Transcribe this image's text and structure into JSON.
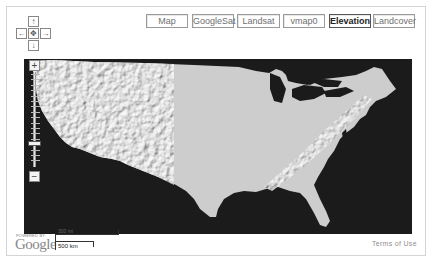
{
  "map_types": [
    {
      "label": "Map",
      "left": 0,
      "width": 42,
      "active": false
    },
    {
      "label": "GoogleSat",
      "left": 46,
      "width": 42,
      "active": false
    },
    {
      "label": "Landsat",
      "left": 91,
      "width": 43,
      "active": false
    },
    {
      "label": "vmap0",
      "left": 137,
      "width": 42,
      "active": false
    },
    {
      "label": "Elevation",
      "left": 183,
      "width": 42,
      "active": true
    },
    {
      "label": "Landcover",
      "left": 227,
      "width": 42,
      "active": false
    }
  ],
  "pan_control": {
    "up": "↑",
    "down": "↓",
    "left": "←",
    "right": "→",
    "center": "✥"
  },
  "zoom_control": {
    "plus": "+",
    "minus": "−",
    "level_ticks": 17,
    "current_level_index": 13
  },
  "map": {
    "layer": "Elevation",
    "region": "Continental United States",
    "land_color": "#cfcfcf",
    "water_color": "#1b1b1b"
  },
  "footer": {
    "powered_by": "POWERED BY",
    "logo": "Google",
    "scale_miles": "300 mi",
    "scale_km": "500 km",
    "terms": "Terms of Use"
  }
}
